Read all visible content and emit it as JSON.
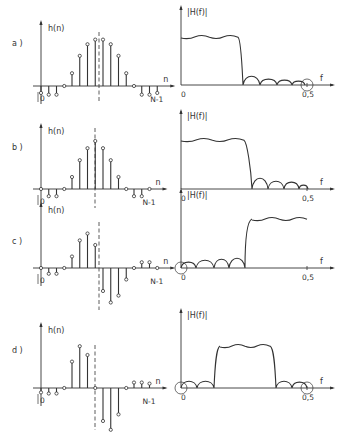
{
  "figure": {
    "stroke_color": "#333333",
    "background": "#ffffff",
    "left_axis_label": "h(n)",
    "right_axis_label": "|H(f)|",
    "n_label": "n",
    "f_label": "f",
    "zero_label": "0",
    "end_n_label": "N-1",
    "end_f_label": "0,5"
  },
  "panels": [
    {
      "label": "a )",
      "impulse": {
        "axis_x": 41,
        "baseline_y": 86,
        "dx": 7.75,
        "center_x": 99,
        "values": [
          -0.12,
          -0.15,
          -0.15,
          0,
          0.22,
          0.52,
          0.72,
          0.8,
          0.8,
          0.72,
          0.52,
          0.22,
          0,
          -0.15,
          -0.15,
          -0.12
        ],
        "scale": 58,
        "dashed_top": 32,
        "dashed_bottom": 102
      },
      "response": {
        "type": "lowpass",
        "axis_x": 181,
        "baseline_y": 85,
        "f05_x": 307,
        "pass_y": 37,
        "cut_start": 238,
        "cut_end": 243,
        "lobes": [
          243,
          260,
          277,
          292,
          305
        ],
        "lobe_h": [
          9,
          6,
          5,
          4
        ],
        "circle_at": "end"
      }
    },
    {
      "label": "b )",
      "impulse": {
        "axis_x": 41,
        "baseline_y": 189,
        "dx": 7.75,
        "center_x": 95,
        "values": [
          0,
          -0.15,
          -0.15,
          0,
          0.25,
          0.6,
          0.85,
          1.0,
          0.85,
          0.6,
          0.25,
          0,
          -0.15,
          -0.15,
          0
        ],
        "scale": 48,
        "dashed_top": 128,
        "dashed_bottom": 208
      },
      "response": {
        "type": "lowpass",
        "axis_x": 181,
        "baseline_y": 189,
        "f05_x": 307,
        "pass_y": 140,
        "cut_start": 244,
        "cut_end": 252,
        "lobes": [
          252,
          268,
          284,
          299,
          308
        ],
        "lobe_h": [
          11,
          8,
          7,
          4
        ],
        "circle_at": "none"
      }
    },
    {
      "label": "c )",
      "impulse": {
        "axis_x": 41,
        "baseline_y": 268,
        "dx": 7.75,
        "center_x": 99,
        "values": [
          0,
          -0.25,
          -0.25,
          0,
          0.5,
          1.2,
          1.5,
          1.0,
          -1.0,
          -1.5,
          -1.2,
          -0.5,
          0,
          0.25,
          0.25,
          0
        ],
        "scale": 23,
        "dashed_top": 222,
        "dashed_bottom": 310
      },
      "response": {
        "type": "highpass",
        "axis_x": 181,
        "baseline_y": 268,
        "f05_x": 307,
        "pass_y": 219,
        "cut_start": 245,
        "cut_end": 252,
        "lobes": [
          181,
          196,
          214,
          229,
          245
        ],
        "lobe_h": [
          6,
          8,
          9,
          10
        ],
        "circle_at": "start"
      }
    },
    {
      "label": "d )",
      "impulse": {
        "axis_x": 41,
        "baseline_y": 388,
        "dx": 7.75,
        "center_x": 95,
        "values": [
          -0.2,
          -0.25,
          -0.25,
          0,
          1.2,
          1.9,
          1.5,
          0,
          -1.5,
          -1.9,
          -1.2,
          0,
          0.25,
          0.25,
          0.2
        ],
        "scale": 22,
        "dashed_top": 345,
        "dashed_bottom": 430
      },
      "response": {
        "type": "bandpass",
        "axis_x": 181,
        "baseline_y": 388,
        "f05_x": 307,
        "pass_y": 346,
        "band_start": 214,
        "band_end": 276,
        "lobes_left": [
          181,
          197,
          214
        ],
        "lobe_h_left": [
          7,
          7
        ],
        "lobes_right": [
          276,
          292,
          307
        ],
        "lobe_h_right": [
          7,
          6
        ],
        "circle_at": "both"
      }
    }
  ]
}
